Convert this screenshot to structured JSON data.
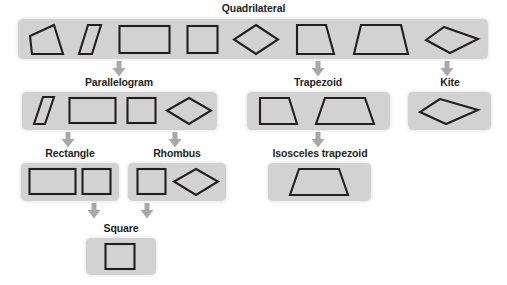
{
  "diagram": {
    "band_color": "#d2d2d2",
    "shape_stroke_color": "#231f20",
    "arrow_color": "#a8a8a8",
    "background_color": "#ffffff"
  },
  "levels": [
    {
      "label": "Quadrilateral",
      "shapes": [
        "irregular-quadrilateral",
        "thin-parallelogram",
        "rectangle",
        "square",
        "rhombus",
        "trapezoid",
        "isosceles-trapezoid",
        "kite"
      ]
    },
    {
      "label": "Parallelogram",
      "shapes": [
        "thin-parallelogram",
        "rectangle",
        "square",
        "rhombus"
      ]
    },
    {
      "label": "Trapezoid",
      "shapes": [
        "trapezoid",
        "isosceles-trapezoid"
      ]
    },
    {
      "label": "Kite",
      "shapes": [
        "kite"
      ]
    },
    {
      "label": "Rectangle",
      "shapes": [
        "rectangle",
        "square"
      ]
    },
    {
      "label": "Rhombus",
      "shapes": [
        "square",
        "rhombus"
      ]
    },
    {
      "label": "Isosceles trapezoid",
      "shapes": [
        "isosceles-trapezoid"
      ]
    },
    {
      "label": "Square",
      "shapes": [
        "square"
      ]
    }
  ],
  "labels": {
    "quadrilateral": "Quadrilateral",
    "parallelogram": "Parallelogram",
    "trapezoid": "Trapezoid",
    "kite": "Kite",
    "rectangle": "Rectangle",
    "rhombus": "Rhombus",
    "isosceles_trapezoid": "Isosceles trapezoid",
    "square": "Square"
  },
  "connections": [
    {
      "from": "Quadrilateral",
      "to": "Parallelogram"
    },
    {
      "from": "Quadrilateral",
      "to": "Trapezoid"
    },
    {
      "from": "Quadrilateral",
      "to": "Kite"
    },
    {
      "from": "Parallelogram",
      "to": "Rectangle"
    },
    {
      "from": "Parallelogram",
      "to": "Rhombus"
    },
    {
      "from": "Trapezoid",
      "to": "Isosceles trapezoid"
    },
    {
      "from": "Rectangle",
      "to": "Square"
    },
    {
      "from": "Rhombus",
      "to": "Square"
    }
  ]
}
